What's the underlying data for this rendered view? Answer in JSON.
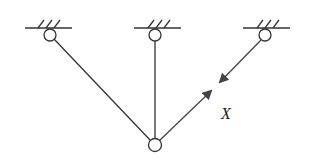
{
  "diagram": {
    "type": "truss / three-bar structure",
    "label_x": "X",
    "supports": [
      "left-support",
      "middle-support",
      "right-support"
    ],
    "colors": {
      "line": "#333333",
      "background": "#ffffff"
    }
  }
}
